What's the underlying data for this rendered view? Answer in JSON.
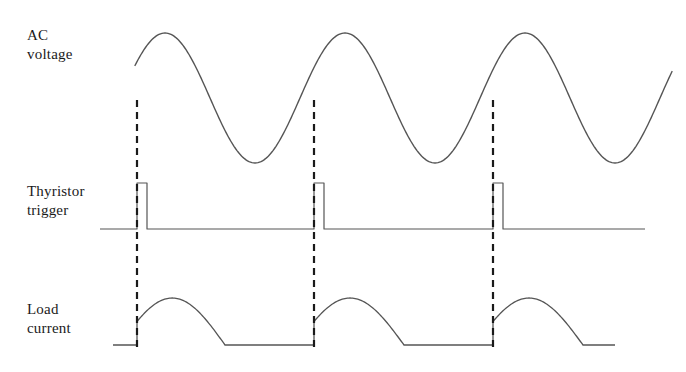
{
  "figure": {
    "title": "",
    "background_color": "#ffffff",
    "trace_color": "#555555",
    "dash_color": "#1a1a1a",
    "width": 686,
    "height": 372
  },
  "labels": {
    "ac_voltage": "AC\nvoltage",
    "thyristor_trigger": "Thyristor\ntrigger",
    "load_current": "Load\ncurrent"
  },
  "chart_data": {
    "type": "line",
    "xlabel": "",
    "ylabel": "",
    "grid": false,
    "legend": null,
    "panels": [
      {
        "name": "ac-voltage",
        "label": "AC\nvoltage",
        "waveform": "sine",
        "baseline_y": 98,
        "amplitude": 65,
        "period_px": 180,
        "x_start": 135,
        "x_end": 672,
        "phase_deg": 30,
        "cycles": 3
      },
      {
        "name": "thyristor-trigger",
        "label": "Thyristor\ntrigger",
        "waveform": "pulse-train",
        "baseline_y": 229,
        "pulse_height": 46,
        "pulse_width_px": 10,
        "x_start": 100,
        "x_end": 645,
        "pulse_x": [
          137,
          314,
          493
        ]
      },
      {
        "name": "load-current",
        "label": "Load\ncurrent",
        "waveform": "phase-controlled-rectified-sine",
        "baseline_y": 345,
        "amplitude": 47,
        "x_start": 113,
        "x_end": 615,
        "firing_x": [
          137,
          314,
          493
        ],
        "conduction_end_x": [
          225,
          404,
          583
        ]
      }
    ],
    "markers": {
      "type": "vertical-dashed-lines",
      "x": [
        137,
        314,
        493
      ],
      "y_top": 100,
      "y_bottom": 347,
      "description": "firing angle alignment lines from AC voltage through trigger to load current"
    }
  }
}
